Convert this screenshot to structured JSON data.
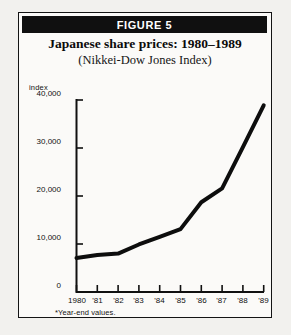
{
  "figure": {
    "header_label": "FIGURE 5",
    "title": "Japanese share prices: 1980–1989",
    "subtitle": "(Nikkei-Dow Jones Index)",
    "footnote": "*Year-end values."
  },
  "chart_data": {
    "type": "line",
    "title": "Japanese share prices: 1980–1989",
    "subtitle": "(Nikkei-Dow Jones Index)",
    "xlabel": "",
    "ylabel": "index",
    "categories": [
      "1980",
      "'81",
      "'82",
      "'83",
      "'84",
      "'85",
      "'86",
      "'87",
      "'88",
      "'89"
    ],
    "values": [
      7100,
      7700,
      8000,
      9900,
      11500,
      13100,
      18700,
      21600,
      30200,
      38900
    ],
    "series": [
      {
        "name": "Nikkei-Dow Jones Index",
        "values": [
          7100,
          7700,
          8000,
          9900,
          11500,
          13100,
          18700,
          21600,
          30200,
          38900
        ]
      }
    ],
    "ylim": [
      0,
      40000
    ],
    "yticks": [
      0,
      10000,
      20000,
      30000,
      40000
    ],
    "ytick_labels": [
      "0",
      "10,000",
      "20,000",
      "30,000",
      "40,000"
    ],
    "grid": false,
    "legend": false,
    "line_color": "#0d0d0d",
    "note": "*Year-end values."
  }
}
